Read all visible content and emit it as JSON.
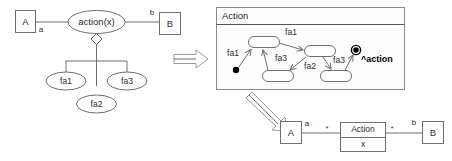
{
  "figure": {
    "background": "#ffffff",
    "line_color": "#6f6f6f",
    "text_color": "#2b2b2b"
  },
  "left_model": {
    "name": "use-case-decomposition",
    "actor_a": "A",
    "actor_b": "B",
    "use_case": "action(x)",
    "role_a": "a",
    "role_b": "b",
    "aggregation_marker": "diamond",
    "sub_actions": [
      {
        "label": "fa1"
      },
      {
        "label": "fa2"
      },
      {
        "label": "fa3"
      }
    ]
  },
  "transition_arrows": {
    "arrow_right_label": "",
    "arrow_down_label": ""
  },
  "state_machine": {
    "frame_title": "Action",
    "initial_state": "filled-circle",
    "final_state": "bullseye",
    "final_annotation": "^action",
    "states": [
      {
        "id": "s1",
        "label": ""
      },
      {
        "id": "s2",
        "label": ""
      },
      {
        "id": "s3",
        "label": ""
      },
      {
        "id": "s4",
        "label": ""
      }
    ],
    "transitions": [
      {
        "from": "initial",
        "to": "s1",
        "label": "fa1"
      },
      {
        "from": "s1",
        "to": "s2",
        "label": "fa1"
      },
      {
        "from": "s3",
        "to": "s1",
        "label": "fa3"
      },
      {
        "from": "s2",
        "to": "s3",
        "label": "fa2"
      },
      {
        "from": "s2",
        "to": "s4",
        "label": "fa3"
      },
      {
        "from": "s4",
        "to": "final",
        "label": ""
      }
    ]
  },
  "class_model": {
    "class_a": "A",
    "class_b": "B",
    "action_class_name": "Action",
    "action_class_attribute": "x",
    "role_a": "a",
    "role_b": "b",
    "multiplicity_left": "*",
    "multiplicity_right": "*"
  }
}
